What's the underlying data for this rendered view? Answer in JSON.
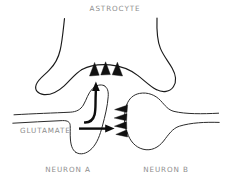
{
  "figure": {
    "background_color": "#ffffff",
    "ink_color": "#1a1a1a",
    "label_color": "#8d8d8d",
    "marker_color": "#111111"
  },
  "labels": {
    "astrocyte": "ASTROCYTE",
    "glutamate": "GLUTAMATE",
    "neuron_a": "NEURON A",
    "neuron_b": "NEURON B"
  },
  "structures": [
    {
      "name": "astrocyte",
      "label": "ASTROCYTE",
      "role": "glial cell enveloping the synapse",
      "position": "top"
    },
    {
      "name": "neuron-a",
      "label": "NEURON A",
      "role": "presynaptic axon terminal releasing glutamate",
      "position": "bottom-left"
    },
    {
      "name": "neuron-b",
      "label": "NEURON B",
      "role": "postsynaptic dendritic spine bearing receptors",
      "position": "bottom-right"
    }
  ],
  "markers": {
    "astrocyte_transporters": {
      "name": "astrocyte-transporter-triangles",
      "count": 3,
      "direction": "up",
      "description": "glutamate transporters on astrocyte membrane"
    },
    "neuron_b_receptors": {
      "name": "neuron-b-receptor-triangles",
      "count": 4,
      "direction": "left",
      "description": "glutamate receptors on postsynaptic membrane"
    }
  },
  "arrows": [
    {
      "name": "glutamate-uptake-arrow",
      "direction": "up",
      "shape": "curved hook then vertical",
      "description": "glutamate uptake from cleft into astrocyte"
    },
    {
      "name": "glutamate-transmission-arrow",
      "direction": "right",
      "shape": "straight horizontal",
      "description": "glutamate crossing cleft to neuron B receptors"
    }
  ]
}
